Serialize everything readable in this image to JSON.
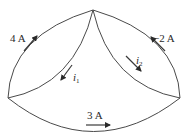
{
  "diagram": {
    "type": "circuit-node-branches",
    "nodes": [
      {
        "id": "top",
        "x": 93,
        "y": 10
      },
      {
        "id": "left",
        "x": 8,
        "y": 98
      },
      {
        "id": "right",
        "x": 180,
        "y": 98
      }
    ],
    "branches": [
      {
        "id": "outer-left",
        "from": "left",
        "to": "top",
        "current_label": "4 A",
        "direction": "toward top"
      },
      {
        "id": "inner-left",
        "from": "top",
        "to": "left",
        "current_label": "i",
        "current_subscript": "1",
        "direction": "toward left"
      },
      {
        "id": "inner-right",
        "from": "top",
        "to": "right",
        "current_label": "i",
        "current_subscript": "2",
        "direction": "toward right"
      },
      {
        "id": "outer-right",
        "from": "right",
        "to": "top",
        "current_label": "−2 A",
        "direction": "toward top"
      },
      {
        "id": "bottom",
        "from": "left",
        "to": "right",
        "current_label": "3 A",
        "direction": "toward right"
      }
    ]
  },
  "labels": {
    "outer_left": "4 A",
    "outer_right": "−2 A",
    "bottom": "3 A",
    "i1_main": "i",
    "i1_sub": "1",
    "i2_main": "i",
    "i2_sub": "2"
  },
  "colors": {
    "line": "#4a4a4a",
    "text": "#2a2a2a",
    "background": "#ffffff"
  }
}
